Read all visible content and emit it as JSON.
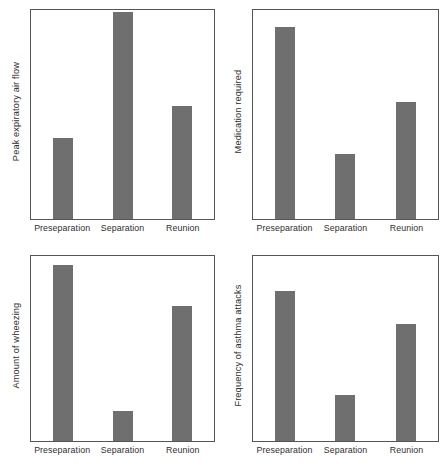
{
  "figure": {
    "background_color": "#ffffff",
    "bar_color": "#6f6f6f",
    "frame_color": "#555555",
    "text_color": "#2f2f2f"
  },
  "panels": [
    {
      "id": "peak-expiratory-air-flow",
      "ylabel": "Peak expiratory air flow",
      "categories": [
        "Preseparation",
        "Separation",
        "Reunion"
      ],
      "values": [
        39,
        99,
        54
      ]
    },
    {
      "id": "medication-required",
      "ylabel": "Medication required",
      "categories": [
        "Preseparation",
        "Separation",
        "Reunion"
      ],
      "values": [
        92,
        31,
        56
      ]
    },
    {
      "id": "amount-of-wheezing",
      "ylabel": "Amount of wheezing",
      "categories": [
        "Preseparation",
        "Separation",
        "Reunion"
      ],
      "values": [
        95,
        16,
        73
      ]
    },
    {
      "id": "frequency-of-asthma-attacks",
      "ylabel": "Frequency of asthma attacks",
      "categories": [
        "Preseparation",
        "Separation",
        "Reunion"
      ],
      "values": [
        81,
        25,
        63
      ]
    }
  ],
  "chart_data": [
    {
      "type": "bar",
      "title": "",
      "xlabel": "",
      "ylabel": "Peak expiratory air flow",
      "categories": [
        "Preseparation",
        "Separation",
        "Reunion"
      ],
      "values": [
        39,
        99,
        54
      ],
      "ylim": [
        0,
        100
      ],
      "grid": false,
      "legend": "none",
      "units": "relative (unlabeled axis)"
    },
    {
      "type": "bar",
      "title": "",
      "xlabel": "",
      "ylabel": "Medication required",
      "categories": [
        "Preseparation",
        "Separation",
        "Reunion"
      ],
      "values": [
        92,
        31,
        56
      ],
      "ylim": [
        0,
        100
      ],
      "grid": false,
      "legend": "none",
      "units": "relative (unlabeled axis)"
    },
    {
      "type": "bar",
      "title": "",
      "xlabel": "",
      "ylabel": "Amount of wheezing",
      "categories": [
        "Preseparation",
        "Separation",
        "Reunion"
      ],
      "values": [
        95,
        16,
        73
      ],
      "ylim": [
        0,
        100
      ],
      "grid": false,
      "legend": "none",
      "units": "relative (unlabeled axis)"
    },
    {
      "type": "bar",
      "title": "",
      "xlabel": "",
      "ylabel": "Frequency of asthma attacks",
      "categories": [
        "Preseparation",
        "Separation",
        "Reunion"
      ],
      "values": [
        81,
        25,
        63
      ],
      "ylim": [
        0,
        100
      ],
      "grid": false,
      "legend": "none",
      "units": "relative (unlabeled axis)"
    }
  ]
}
